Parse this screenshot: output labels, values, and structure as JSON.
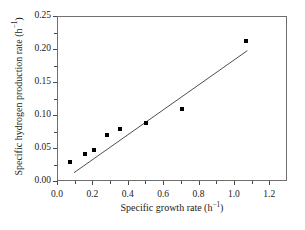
{
  "chart_data": {
    "type": "scatter",
    "title": "",
    "xlabel": "Specific growth rate (h−1)",
    "xlabel_base": "Specific growth rate (h",
    "xlabel_exp": "−1",
    "xlabel_close": ")",
    "ylabel": "Specific hydrogen production rate (h−1)",
    "ylabel_base": "Specific hydrogen production rate (h",
    "ylabel_exp": "−1",
    "ylabel_close": ")",
    "xlim": [
      0.0,
      1.3
    ],
    "ylim": [
      0.0,
      0.25
    ],
    "xticks": [
      "0.0",
      "0.2",
      "0.4",
      "0.6",
      "0.8",
      "1.0",
      "1.2"
    ],
    "xtick_values": [
      0.0,
      0.2,
      0.4,
      0.6,
      0.8,
      1.0,
      1.2
    ],
    "xminor_values": [
      0.1,
      0.3,
      0.5,
      0.7,
      0.9,
      1.1
    ],
    "yticks": [
      "0.00",
      "0.05",
      "0.10",
      "0.15",
      "0.20",
      "0.25"
    ],
    "ytick_values": [
      0.0,
      0.05,
      0.1,
      0.15,
      0.2,
      0.25
    ],
    "yminor_values": [
      0.025,
      0.075,
      0.125,
      0.175,
      0.225
    ],
    "grid": false,
    "legend": null,
    "marker_style": "filled-square",
    "marker_color": "#000000",
    "line_color": "#3a3a3a",
    "frame_color": "#6f6f6f",
    "x": [
      0.07,
      0.155,
      0.205,
      0.275,
      0.35,
      0.5,
      0.7,
      1.065
    ],
    "y": [
      0.03,
      0.043,
      0.048,
      0.071,
      0.081,
      0.09,
      0.111,
      0.214
    ],
    "points": [
      {
        "x": 0.07,
        "y": 0.03
      },
      {
        "x": 0.155,
        "y": 0.043
      },
      {
        "x": 0.205,
        "y": 0.048
      },
      {
        "x": 0.275,
        "y": 0.071
      },
      {
        "x": 0.35,
        "y": 0.081
      },
      {
        "x": 0.5,
        "y": 0.09
      },
      {
        "x": 0.7,
        "y": 0.111
      },
      {
        "x": 1.065,
        "y": 0.214
      }
    ],
    "trendline": {
      "type": "linear-fit",
      "x_start": 0.09,
      "y_start": 0.014,
      "x_end": 1.07,
      "y_end": 0.199
    }
  }
}
